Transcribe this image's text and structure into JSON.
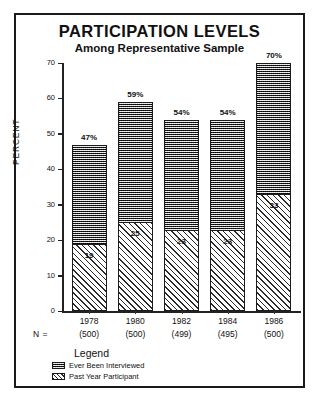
{
  "chart_data": {
    "type": "bar",
    "title": "PARTICIPATION LEVELS",
    "subtitle": "Among Representative Sample",
    "xlabel": "",
    "ylabel": "PERCENT",
    "ylim": [
      0,
      70
    ],
    "yticks": [
      0,
      10,
      20,
      30,
      40,
      50,
      60,
      70
    ],
    "ytick_labels": [
      "0",
      "10",
      "20",
      "30",
      "40",
      "50",
      "60",
      "70"
    ],
    "grid": false,
    "stacked": true,
    "legend_position": "below-axes-left",
    "categories": [
      "1978",
      "1980",
      "1982",
      "1984",
      "1986"
    ],
    "series": [
      {
        "name": "Ever Been Interviewed",
        "pattern": "dark-checker",
        "values": [
          47,
          59,
          54,
          54,
          70
        ],
        "value_labels": [
          "47%",
          "59%",
          "54%",
          "54%",
          "70%"
        ]
      },
      {
        "name": "Past Year Participant",
        "pattern": "diagonal-hatch",
        "values": [
          19,
          25,
          23,
          23,
          33
        ],
        "value_labels": [
          "19",
          "25",
          "23",
          "23",
          "33"
        ]
      }
    ],
    "n_label": "N =",
    "n_values": [
      "(500)",
      "(500)",
      "(499)",
      "(495)",
      "(500)"
    ]
  },
  "legend": {
    "title": "Legend",
    "items": [
      {
        "label": "Ever Been Interviewed",
        "swatch": "dark-checker-swatch"
      },
      {
        "label": "Past Year Participant",
        "swatch": "diagonal-hatch-swatch"
      }
    ]
  },
  "colors": {
    "ink": "#111111",
    "frame": "#1a1a1a",
    "background": "#ffffff"
  }
}
